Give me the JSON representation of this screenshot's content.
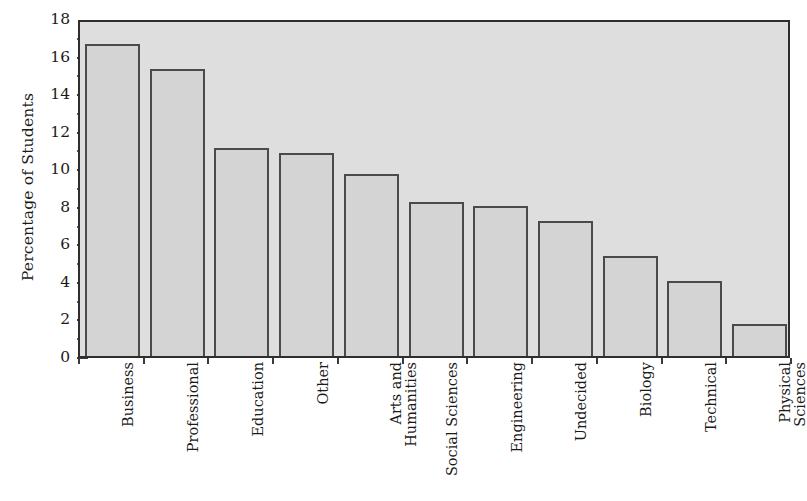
{
  "chart_data": {
    "type": "bar",
    "title": "",
    "xlabel": "",
    "ylabel": "Percentage of Students",
    "ylim": [
      0,
      18
    ],
    "ytick_step": 2,
    "minor_ticks": true,
    "grid": false,
    "legend": "none",
    "orientation": "vertical",
    "categories": [
      "Business",
      "Professional",
      "Education",
      "Other",
      "Arts and Humanities",
      "Social Sciences",
      "Engineering",
      "Undecided",
      "Biology",
      "Technical",
      "Physical Sciences"
    ],
    "values": [
      16.6,
      15.3,
      11.1,
      10.8,
      9.7,
      8.2,
      8.0,
      7.2,
      5.3,
      4.0,
      1.7
    ]
  },
  "axes": {
    "y_title": "Percentage of Students",
    "y_ticks": [
      "18",
      "16",
      "14",
      "12",
      "10",
      "8",
      "6",
      "4",
      "2",
      "0"
    ],
    "y_tick_values": [
      18,
      16,
      14,
      12,
      10,
      8,
      6,
      4,
      2,
      0
    ]
  },
  "x_labels": [
    {
      "line1": "Business",
      "line2": ""
    },
    {
      "line1": "Professional",
      "line2": ""
    },
    {
      "line1": "Education",
      "line2": ""
    },
    {
      "line1": "Other",
      "line2": ""
    },
    {
      "line1": "Arts and",
      "line2": "Humanities"
    },
    {
      "line1": "Social Sciences",
      "line2": ""
    },
    {
      "line1": "Engineering",
      "line2": ""
    },
    {
      "line1": "Undecided",
      "line2": ""
    },
    {
      "line1": "Biology",
      "line2": ""
    },
    {
      "line1": "Technical",
      "line2": ""
    },
    {
      "line1": "Physical",
      "line2": "Sciences"
    }
  ],
  "colors": {
    "plot_background": "#dedede",
    "frame": "#2e2e2e",
    "bar_fill": "#d4d4d4",
    "bar_stroke": "#4a4a4a",
    "text": "#1a1a1a",
    "page_background": "#ffffff"
  }
}
